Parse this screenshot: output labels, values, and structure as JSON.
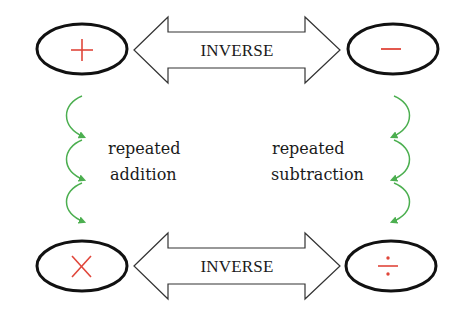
{
  "diagram": {
    "operations": {
      "addition": {
        "symbol": "+",
        "name": "addition"
      },
      "subtraction": {
        "symbol": "−",
        "name": "subtraction"
      },
      "multiplication": {
        "symbol": "×",
        "name": "multiplication"
      },
      "division": {
        "symbol": "÷",
        "name": "division"
      }
    },
    "top_arrow": {
      "label": "INVERSE",
      "connects": [
        "addition",
        "subtraction"
      ]
    },
    "bottom_arrow": {
      "label": "INVERSE",
      "connects": [
        "multiplication",
        "division"
      ]
    },
    "left_relation": {
      "line1": "repeated",
      "line2": "addition",
      "from": "addition",
      "to": "multiplication",
      "arc_count": 3
    },
    "right_relation": {
      "line1": "repeated",
      "line2": "subtraction",
      "from": "subtraction",
      "to": "division",
      "arc_count": 3
    },
    "colors": {
      "symbol": "#e0463a",
      "curved_arrow": "#4caf50",
      "outline": "#111111",
      "text": "#1a1a1a",
      "background": "#ffffff"
    }
  }
}
